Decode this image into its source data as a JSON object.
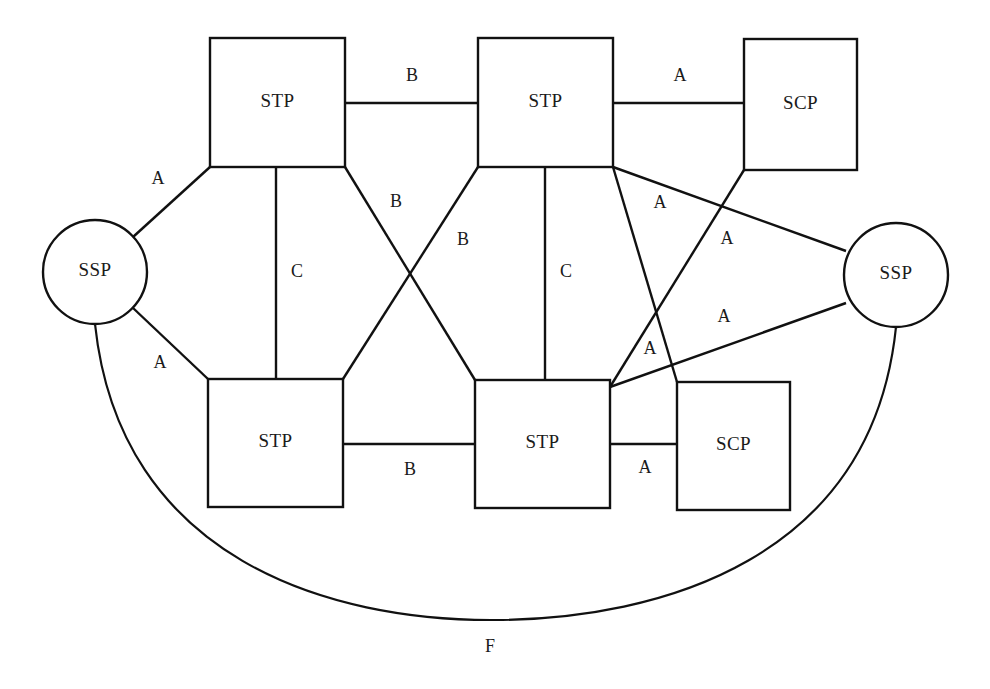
{
  "diagram": {
    "type": "ss7-network-topology",
    "background_color": "#ffffff",
    "line_color": "#111111",
    "text_color": "#1a1a1a",
    "width": 990,
    "height": 689
  },
  "nodes": [
    {
      "id": "ssp-left",
      "label": "SSP",
      "shape": "circle",
      "cx": 95,
      "cy": 272,
      "r": 52
    },
    {
      "id": "ssp-right",
      "label": "SSP",
      "shape": "circle",
      "cx": 896,
      "cy": 275,
      "r": 52
    },
    {
      "id": "stp-tl",
      "label": "STP",
      "shape": "rect",
      "x": 210,
      "y": 38,
      "w": 135,
      "h": 129
    },
    {
      "id": "stp-tr",
      "label": "STP",
      "shape": "rect",
      "x": 478,
      "y": 38,
      "w": 135,
      "h": 129
    },
    {
      "id": "scp-top",
      "label": "SCP",
      "shape": "rect",
      "x": 744,
      "y": 39,
      "w": 113,
      "h": 131
    },
    {
      "id": "stp-bl",
      "label": "STP",
      "shape": "rect",
      "x": 208,
      "y": 379,
      "w": 135,
      "h": 128
    },
    {
      "id": "stp-br",
      "label": "STP",
      "shape": "rect",
      "x": 475,
      "y": 380,
      "w": 135,
      "h": 128
    },
    {
      "id": "scp-bottom",
      "label": "SCP",
      "shape": "rect",
      "x": 677,
      "y": 382,
      "w": 113,
      "h": 128
    }
  ],
  "links": [
    {
      "id": "stp-tl--stp-tr",
      "label": "B",
      "label_x": 412,
      "label_y": 77,
      "from": "stp-tl",
      "to": "stp-tr",
      "kind": "line",
      "x1": 345,
      "y1": 103,
      "x2": 478,
      "y2": 103
    },
    {
      "id": "stp-tr--scp-top",
      "label": "A",
      "label_x": 680,
      "label_y": 77,
      "from": "stp-tr",
      "to": "scp-top",
      "kind": "line",
      "x1": 613,
      "y1": 103,
      "x2": 744,
      "y2": 103
    },
    {
      "id": "ssp-left--stp-tl",
      "label": "A",
      "label_x": 158,
      "label_y": 180,
      "from": "ssp-left",
      "to": "stp-tl",
      "kind": "line",
      "x1": 133,
      "y1": 237,
      "x2": 210,
      "y2": 167
    },
    {
      "id": "ssp-left--stp-bl",
      "label": "A",
      "label_x": 160,
      "label_y": 364,
      "from": "ssp-left",
      "to": "stp-bl",
      "kind": "line",
      "x1": 133,
      "y1": 308,
      "x2": 208,
      "y2": 379
    },
    {
      "id": "stp-tl--stp-bl",
      "label": "C",
      "label_x": 297,
      "label_y": 273,
      "from": "stp-tl",
      "to": "stp-bl",
      "kind": "line",
      "x1": 276,
      "y1": 167,
      "x2": 276,
      "y2": 379
    },
    {
      "id": "stp-tr--stp-br",
      "label": "C",
      "label_x": 566,
      "label_y": 273,
      "from": "stp-tr",
      "to": "stp-br",
      "kind": "line",
      "x1": 545,
      "y1": 167,
      "x2": 545,
      "y2": 380
    },
    {
      "id": "stp-tl--stp-br",
      "label": "B",
      "label_x": 396,
      "label_y": 203,
      "from": "stp-tl",
      "to": "stp-br",
      "kind": "line",
      "x1": 345,
      "y1": 167,
      "x2": 475,
      "y2": 380
    },
    {
      "id": "stp-tr--stp-bl",
      "label": "B",
      "label_x": 463,
      "label_y": 241,
      "from": "stp-tr",
      "to": "stp-bl",
      "kind": "line",
      "x1": 478,
      "y1": 167,
      "x2": 343,
      "y2": 379
    },
    {
      "id": "stp-bl--stp-br",
      "label": "B",
      "label_x": 410,
      "label_y": 471,
      "from": "stp-bl",
      "to": "stp-br",
      "kind": "line",
      "x1": 343,
      "y1": 444,
      "x2": 475,
      "y2": 444
    },
    {
      "id": "stp-br--scp-bottom",
      "label": "A",
      "label_x": 645,
      "label_y": 469,
      "from": "stp-br",
      "to": "scp-bottom",
      "kind": "line",
      "x1": 610,
      "y1": 444,
      "x2": 677,
      "y2": 444
    },
    {
      "id": "stp-tr--scp-bottom",
      "label": "A",
      "label_x": 660,
      "label_y": 204,
      "from": "stp-tr",
      "to": "scp-bottom",
      "kind": "line",
      "x1": 613,
      "y1": 167,
      "x2": 677,
      "y2": 382
    },
    {
      "id": "scp-top--stp-br",
      "label": "A",
      "label_x": 650,
      "label_y": 350,
      "from": "scp-top",
      "to": "stp-br",
      "kind": "line",
      "x1": 744,
      "y1": 170,
      "x2": 610,
      "y2": 387
    },
    {
      "id": "stp-tr--ssp-right",
      "label": "A",
      "label_x": 727,
      "label_y": 240,
      "from": "stp-tr",
      "to": "ssp-right",
      "kind": "line",
      "x1": 613,
      "y1": 167,
      "x2": 846,
      "y2": 251
    },
    {
      "id": "stp-br--ssp-right",
      "label": "A",
      "label_x": 724,
      "label_y": 318,
      "from": "stp-br",
      "to": "ssp-right",
      "kind": "line",
      "x1": 610,
      "y1": 387,
      "x2": 846,
      "y2": 303
    },
    {
      "id": "ssp-left--ssp-right",
      "label": "F",
      "label_x": 490,
      "label_y": 648,
      "from": "ssp-left",
      "to": "ssp-right",
      "kind": "arc",
      "path": "M 95 324 C 120 560 330 621 495 620 C 660 619 872 560 896 327"
    }
  ]
}
